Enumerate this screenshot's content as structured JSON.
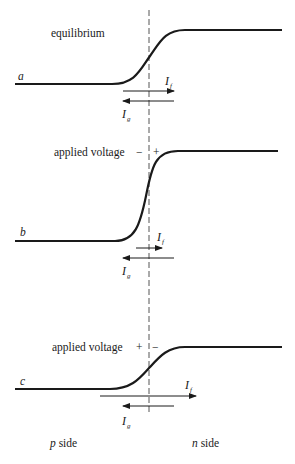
{
  "diagram": {
    "panels": [
      {
        "id": "a",
        "letter": "a",
        "title": "equilibrium",
        "polarity_left": "",
        "polarity_right": "",
        "current_f": "I",
        "current_f_sub": "f",
        "current_g": "I",
        "current_g_sub": "g"
      },
      {
        "id": "b",
        "letter": "b",
        "title": "applied voltage",
        "polarity_left": "−",
        "polarity_right": "+",
        "current_f": "I",
        "current_f_sub": "f",
        "current_g": "I",
        "current_g_sub": "g"
      },
      {
        "id": "c",
        "letter": "c",
        "title": "applied voltage",
        "polarity_left": "+",
        "polarity_right": "−",
        "current_f": "I",
        "current_f_sub": "f",
        "current_g": "I",
        "current_g_sub": "g"
      }
    ],
    "footer": {
      "left_italic": "p",
      "left_rest": " side",
      "right_italic": "n",
      "right_rest": " side"
    },
    "colors": {
      "line": "#1a1a1a",
      "dash": "#555555"
    }
  }
}
